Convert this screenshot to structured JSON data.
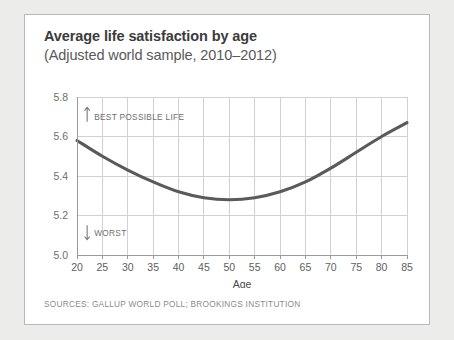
{
  "card": {
    "title": "Average life satisfaction by age",
    "subtitle": "(Adjusted world sample, 2010–2012)",
    "sources": "SOURCES: GALLUP WORLD POLL; BROOKINGS INSTITUTION"
  },
  "chart_data": {
    "type": "line",
    "title": "Average life satisfaction by age",
    "subtitle": "(Adjusted world sample, 2010–2012)",
    "xlabel": "Age",
    "ylabel": "",
    "xlim": [
      20,
      85
    ],
    "ylim": [
      5.0,
      5.8
    ],
    "xticks": [
      20,
      25,
      30,
      35,
      40,
      45,
      50,
      55,
      60,
      65,
      70,
      75,
      80,
      85
    ],
    "yticks": [
      "5.0",
      "5.2",
      "5.4",
      "5.6",
      "5.8"
    ],
    "grid": true,
    "legend": false,
    "line_color": "#5a5a5a",
    "x": [
      20,
      25,
      30,
      35,
      40,
      45,
      50,
      55,
      60,
      65,
      70,
      75,
      80,
      85
    ],
    "values": [
      5.58,
      5.5,
      5.43,
      5.37,
      5.32,
      5.29,
      5.28,
      5.29,
      5.32,
      5.37,
      5.44,
      5.52,
      5.6,
      5.67
    ],
    "series": [
      {
        "name": "Average life satisfaction",
        "values": [
          5.58,
          5.5,
          5.43,
          5.37,
          5.32,
          5.29,
          5.28,
          5.29,
          5.32,
          5.37,
          5.44,
          5.52,
          5.6,
          5.67
        ]
      }
    ],
    "annotations": [
      {
        "text": "BEST POSSIBLE LIFE",
        "arrow": "up",
        "x": 22,
        "y": 5.72
      },
      {
        "text": "WORST",
        "arrow": "down",
        "x": 22,
        "y": 5.11
      }
    ]
  }
}
